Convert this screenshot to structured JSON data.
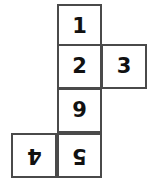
{
  "diagram": {
    "type": "cube-net",
    "shape_description": "cross-shaped net of six squares",
    "background_color": "#ffffff",
    "border_color": "#4a4a4a",
    "text_color": "#111111",
    "cell_size": 45,
    "cells": [
      {
        "id": "cell-1",
        "label": "1",
        "column": "middle",
        "row": 1,
        "x": 57,
        "y": 4,
        "rotation": 0
      },
      {
        "id": "cell-2",
        "label": "2",
        "column": "middle",
        "row": 2,
        "x": 57,
        "y": 44,
        "rotation": 0
      },
      {
        "id": "cell-3",
        "label": "3",
        "column": "right",
        "row": 2,
        "x": 101,
        "y": 44,
        "rotation": 0
      },
      {
        "id": "cell-9",
        "label": "9",
        "column": "middle",
        "row": 3,
        "x": 57,
        "y": 88,
        "rotation": 0
      },
      {
        "id": "cell-4",
        "label": "4",
        "column": "left",
        "row": 4,
        "x": 11,
        "y": 133,
        "rotation": 180
      },
      {
        "id": "cell-5",
        "label": "5",
        "column": "middle",
        "row": 4,
        "x": 57,
        "y": 133,
        "rotation": 180
      }
    ]
  }
}
